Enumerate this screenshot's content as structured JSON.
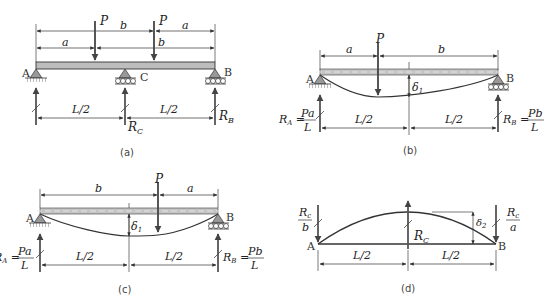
{
  "figure": {
    "panels": [
      {
        "id": "a",
        "caption": "(a)",
        "load_label": "P",
        "dims_top": [
          "b",
          "a"
        ],
        "dims_second": [
          "a",
          "b"
        ],
        "support_labels": [
          "A",
          "C",
          "B"
        ],
        "span_labels": [
          "L/2",
          "L/2"
        ],
        "reactions": [
          "R_C",
          "R_B"
        ],
        "reaction_display": {
          "C": "R",
          "C_sub": "C",
          "B": "R",
          "B_sub": "B"
        }
      },
      {
        "id": "b",
        "caption": "(b)",
        "load_label": "P",
        "dims": [
          "a",
          "b"
        ],
        "support_labels": [
          "A",
          "B"
        ],
        "deflection_label": "δ",
        "deflection_sub": "1",
        "span_labels": [
          "L/2",
          "L/2"
        ],
        "reaction_A": {
          "lhs": "R",
          "sub": "A",
          "num": "Pa",
          "den": "L"
        },
        "reaction_B": {
          "lhs": "R",
          "sub": "B",
          "num": "Pb",
          "den": "L"
        }
      },
      {
        "id": "c",
        "caption": "(c)",
        "load_label": "P",
        "dims": [
          "b",
          "a"
        ],
        "support_labels": [
          "A",
          "B"
        ],
        "deflection_label": "δ",
        "deflection_sub": "1",
        "span_labels": [
          "L/2",
          "L/2"
        ],
        "reaction_A": {
          "lhs": "R",
          "sub": "A",
          "num": "Pa",
          "den": "L"
        },
        "reaction_B": {
          "lhs": "R",
          "sub": "B",
          "num": "Pb",
          "den": "L"
        }
      },
      {
        "id": "d",
        "caption": "(d)",
        "support_labels": [
          "A",
          "B"
        ],
        "deflection_label": "δ",
        "deflection_sub": "2",
        "center_force": {
          "lhs": "R",
          "sub": "C"
        },
        "end_force_A": {
          "num": "R",
          "num_sub": "c",
          "den": "b"
        },
        "end_force_B": {
          "num": "R",
          "num_sub": "c",
          "den": "a"
        },
        "span_labels": [
          "L/2",
          "L/2"
        ]
      }
    ],
    "colors": {
      "line": "#333333",
      "beam_fill": "#b8b8b8",
      "support_fill": "#9a9a9a",
      "arrow": "#555555"
    }
  }
}
